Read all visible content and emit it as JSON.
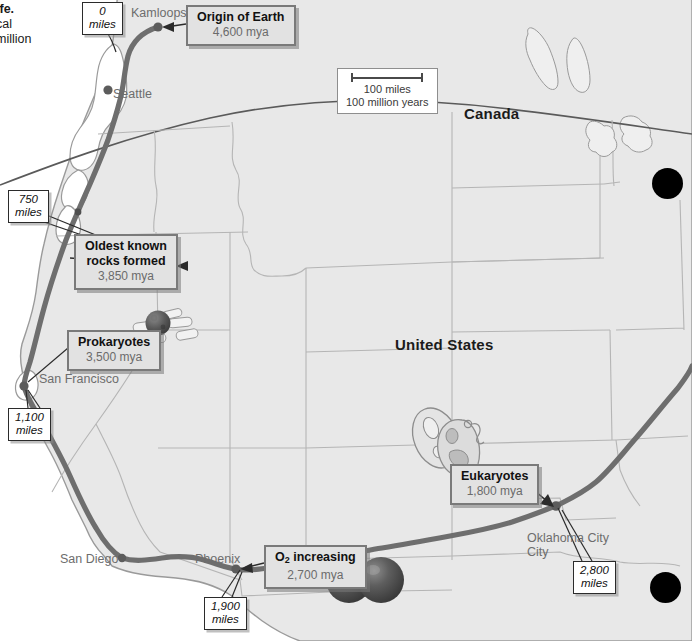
{
  "page": {
    "width": 692,
    "height": 641,
    "background": "#ffffff",
    "edge_text_lines": [
      "ife.",
      "cal",
      "million"
    ]
  },
  "map": {
    "land_fill": "#e8e8e8",
    "land_stroke": "#9a9a9a",
    "state_stroke": "#b5b5b5",
    "route_color": "#6e6e6e",
    "water_fill": "#ffffff",
    "country_labels": [
      {
        "name": "Canada",
        "text": "Canada",
        "x": 464,
        "y": 105
      },
      {
        "name": "United States",
        "text": "United States",
        "x": 395,
        "y": 336
      }
    ],
    "city_labels": [
      {
        "name": "Kamloops",
        "text": "Kamloops",
        "x": 131,
        "y": 6
      },
      {
        "name": "Seattle",
        "text": "Seattle",
        "x": 113,
        "y": 87
      },
      {
        "name": "San Francisco",
        "text": "San Francisco",
        "x": 39,
        "y": 372
      },
      {
        "name": "San Diego",
        "text": "San Diego",
        "x": 60,
        "y": 552
      },
      {
        "name": "Phoenix",
        "text": "Phoenix",
        "x": 195,
        "y": 552
      },
      {
        "name": "Oklahoma City",
        "text": "Oklahoma City",
        "x": 527,
        "y": 531,
        "line2": "City"
      }
    ]
  },
  "scale": {
    "distance": "100 miles",
    "time": "100 million years",
    "x": 337,
    "y": 68,
    "width": 92
  },
  "events": [
    {
      "id": "origin-of-earth",
      "title": "Origin of Earth",
      "title_pre": "Origin of Earth",
      "subtitle": "4,600 mya",
      "x": 186,
      "y": 5
    },
    {
      "id": "oldest-known-rocks",
      "title": "Oldest known",
      "title2": "rocks formed",
      "subtitle": "3,850 mya",
      "x": 74,
      "y": 234
    },
    {
      "id": "prokaryotes",
      "title": "Prokaryotes",
      "subtitle": "3,500 mya",
      "x": 67,
      "y": 330
    },
    {
      "id": "eukaryotes",
      "title": "Eukaryotes",
      "subtitle": "1,800 mya",
      "x": 450,
      "y": 464
    },
    {
      "id": "o2-increasing",
      "title_pre": "O",
      "title_sub": "2",
      "title_post": " increasing",
      "subtitle": "2,700 mya",
      "x": 264,
      "y": 545
    }
  ],
  "distance_callouts": [
    {
      "id": "dist-0",
      "value": "0",
      "unit": "miles",
      "x": 82,
      "y": 2
    },
    {
      "id": "dist-750",
      "value": "750",
      "unit": "miles",
      "x": 8,
      "y": 190
    },
    {
      "id": "dist-1100",
      "value": "1,100",
      "unit": "miles",
      "x": 8,
      "y": 408
    },
    {
      "id": "dist-1900",
      "value": "1,900",
      "unit": "miles",
      "x": 204,
      "y": 597
    },
    {
      "id": "dist-2800",
      "value": "2,800",
      "unit": "miles",
      "x": 573,
      "y": 561
    }
  ],
  "organisms": [
    {
      "id": "prokaryote-illustration",
      "x": 138,
      "y": 305,
      "label": "prokaryote-cells"
    },
    {
      "id": "eukaryote-illustration",
      "x": 414,
      "y": 414,
      "label": "eukaryote-cells"
    },
    {
      "id": "oxygen-molecule",
      "x": 328,
      "y": 555,
      "label": "o2-molecule"
    }
  ],
  "artifacts": [
    {
      "id": "hole-top-right",
      "x": 652,
      "y": 168,
      "d": 31
    },
    {
      "id": "hole-bottom-right",
      "x": 650,
      "y": 572,
      "d": 31
    }
  ]
}
